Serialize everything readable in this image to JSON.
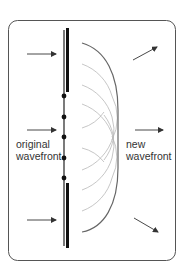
{
  "diagram": {
    "labels": {
      "original_line1": "original",
      "original_line2": "wavefront",
      "new_line1": "new",
      "new_line2": "wavefront"
    },
    "colors": {
      "frame": "#555555",
      "barrier": "#111111",
      "wavefront_line": "#222222",
      "new_wavefront": "#666666",
      "wavelets": "#b5b5b5",
      "arrows": "#333333",
      "text": "#333333"
    },
    "sources": [
      {
        "x": 64,
        "y": 96
      },
      {
        "x": 64,
        "y": 117
      },
      {
        "x": 64,
        "y": 137
      },
      {
        "x": 64,
        "y": 158
      },
      {
        "x": 64,
        "y": 178
      }
    ],
    "incoming_arrows": 3,
    "outgoing_arrows": 3
  }
}
